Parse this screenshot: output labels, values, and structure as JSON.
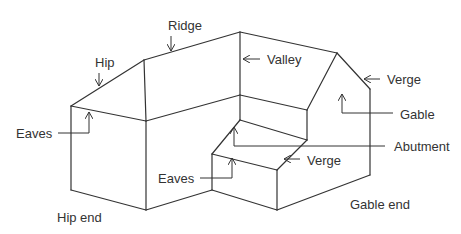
{
  "diagram": {
    "colors": {
      "line": "#333333",
      "background": "#ffffff"
    },
    "labels": {
      "ridge": "Ridge",
      "hip": "Hip",
      "valley": "Valley",
      "verge_top": "Verge",
      "gable": "Gable",
      "eaves_left": "Eaves",
      "abutment": "Abutment",
      "verge_bottom": "Verge",
      "eaves_bottom": "Eaves",
      "hip_end": "Hip end",
      "gable_end": "Gable end"
    }
  }
}
